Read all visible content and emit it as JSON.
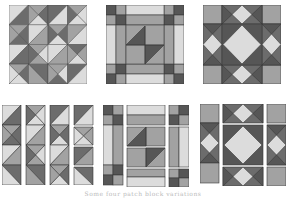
{
  "figure": {
    "caption": "Some four patch block variations",
    "colors": {
      "light": "#dcdcdc",
      "mid": "#a2a2a2",
      "dark": "#6c6c6c",
      "darker": "#565656",
      "stroke": "#3a3a3a"
    },
    "blocks": [
      {
        "id": "pinwheel-block",
        "row": 1,
        "col": 1,
        "style": "hourglass-triangles"
      },
      {
        "id": "nine-patch-frame-block",
        "row": 1,
        "col": 2,
        "style": "framed-center-with-half-triangles"
      },
      {
        "id": "star-diamond-block",
        "row": 1,
        "col": 3,
        "style": "square-in-square-star"
      },
      {
        "id": "pinwheel-exploded",
        "row": 2,
        "col": 1,
        "style": "columns"
      },
      {
        "id": "frame-exploded",
        "row": 2,
        "col": 2,
        "style": "pieces"
      },
      {
        "id": "star-exploded",
        "row": 2,
        "col": 3,
        "style": "pieces"
      }
    ]
  }
}
